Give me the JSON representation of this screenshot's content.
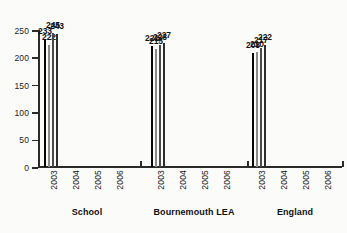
{
  "chart_data": {
    "type": "bar",
    "title": "",
    "subtitle": "",
    "xlabel": "",
    "ylabel": "",
    "ylim": [
      0,
      250
    ],
    "yticks": [
      0,
      50,
      100,
      150,
      200,
      250
    ],
    "grid": false,
    "legend": "none",
    "categories": [
      "School",
      "Bournemouth LEA",
      "England"
    ],
    "x": [
      "2003",
      "2004",
      "2005",
      "2006"
    ],
    "series": [
      {
        "name": "2003",
        "color": "#070707",
        "values": [
          233,
          221,
          208
        ]
      },
      {
        "name": "2004",
        "color": "#d6d6d6",
        "values": [
          222,
          215,
          210
        ]
      },
      {
        "name": "2005",
        "color": "#565656",
        "values": [
          245,
          223,
          217
        ]
      },
      {
        "name": "2006",
        "color": "#353535",
        "values": [
          243,
          227,
          222
        ]
      }
    ],
    "groups": [
      {
        "label": "School",
        "bars": [
          {
            "year": "2003",
            "value": 233
          },
          {
            "year": "2004",
            "value": 222
          },
          {
            "year": "2005",
            "value": 245
          },
          {
            "year": "2006",
            "value": 243
          }
        ]
      },
      {
        "label": "Bournemouth LEA",
        "bars": [
          {
            "year": "2003",
            "value": 221
          },
          {
            "year": "2004",
            "value": 215
          },
          {
            "year": "2005",
            "value": 223
          },
          {
            "year": "2006",
            "value": 227
          }
        ]
      },
      {
        "label": "England",
        "bars": [
          {
            "year": "2003",
            "value": 208
          },
          {
            "year": "2004",
            "value": 210
          },
          {
            "year": "2005",
            "value": 217
          },
          {
            "year": "2006",
            "value": 222
          }
        ]
      }
    ]
  }
}
